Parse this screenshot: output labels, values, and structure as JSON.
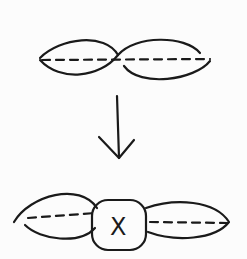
{
  "diagram": {
    "center_box_label": "X",
    "stroke_color": "#1a1a1a",
    "background": "#fcfcfc"
  }
}
